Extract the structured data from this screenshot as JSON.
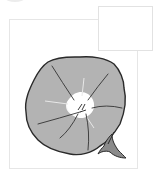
{
  "illustration": {
    "subject": "morning-glory-flower",
    "colors": {
      "petal": "#b3b3b3",
      "outline": "#2a2a2a",
      "throat": "#ffffff",
      "vein": "#333333",
      "frame": "#e6e6e6",
      "background": "#ffffff"
    }
  },
  "frames": [
    {
      "name": "main-frame"
    },
    {
      "name": "side-frame"
    }
  ]
}
